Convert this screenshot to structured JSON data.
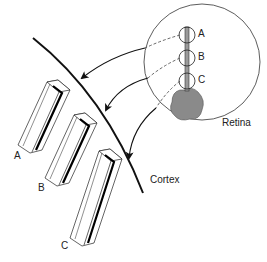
{
  "diagram": {
    "labels": {
      "retina": "Retina",
      "cortex": "Cortex",
      "retina_a": "A",
      "retina_b": "B",
      "retina_c": "C",
      "column_a": "A",
      "column_b": "B",
      "column_c": "C"
    },
    "colors": {
      "line": "#111111",
      "blob": "#8a8a8a",
      "bar": "#9a9a9a",
      "stripe": "#000000"
    }
  }
}
